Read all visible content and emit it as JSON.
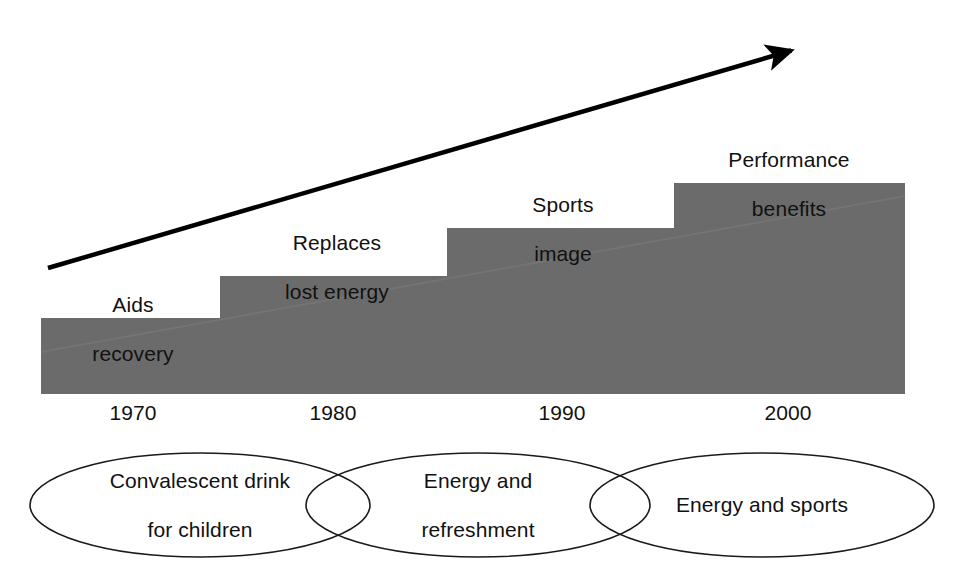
{
  "figure": {
    "type": "evolution-step-diagram",
    "background_color": "#ffffff",
    "step_fill_color": "#6b6b6b",
    "line_color": "#000000",
    "text_color": "#111111"
  },
  "chart_data": {
    "type": "bar",
    "title": "",
    "subtitle": "",
    "xlabel": "",
    "ylabel": "",
    "grid": false,
    "legend": "none",
    "categories": [
      "1970",
      "1980",
      "1990",
      "2000"
    ],
    "values": [
      1,
      2,
      3,
      4
    ],
    "value_labels": [
      "Aids recovery",
      "Replaces lost energy",
      "Sports image",
      "Performance benefits"
    ],
    "annotations": [
      {
        "name": "growth-arrow",
        "text": "",
        "from": [
          48,
          268
        ],
        "to": [
          800,
          48
        ]
      }
    ],
    "overlay_sets": [
      "Convalescent drink for children",
      "Energy and refreshment",
      "Energy and sports"
    ]
  },
  "steps": [
    {
      "id": "step-1970",
      "label_line1": "Aids",
      "label_line2": "recovery",
      "year": "1970",
      "x0": 41,
      "x1": 220,
      "top": 318
    },
    {
      "id": "step-1980",
      "label_line1": "Replaces",
      "label_line2": "lost energy",
      "year": "1980",
      "x0": 220,
      "x1": 447,
      "top": 276
    },
    {
      "id": "step-1990",
      "label_line1": "Sports",
      "label_line2": "image",
      "year": "1990",
      "x0": 447,
      "x1": 674,
      "top": 228
    },
    {
      "id": "step-2000",
      "label_line1": "Performance",
      "label_line2": "benefits",
      "year": "2000",
      "x0": 674,
      "x1": 905,
      "top": 183
    }
  ],
  "step_labels": [
    {
      "line1": "Aids",
      "line2": "recovery",
      "cx": 133,
      "y": 268
    },
    {
      "line1": "Replaces",
      "line2": "lost energy",
      "cx": 337,
      "y": 206
    },
    {
      "line1": "Sports",
      "line2": "image",
      "cx": 563,
      "y": 168
    },
    {
      "line1": "Performance",
      "line2": "benefits",
      "cx": 789,
      "y": 123
    }
  ],
  "years": [
    {
      "text": "1970",
      "cx": 133,
      "y": 401
    },
    {
      "text": "1980",
      "cx": 333,
      "y": 401
    },
    {
      "text": "1990",
      "cx": 562,
      "y": 401
    },
    {
      "text": "2000",
      "cx": 788,
      "y": 401
    }
  ],
  "ellipses": [
    {
      "id": "ellipse-convalescent",
      "line1": "Convalescent drink",
      "line2": "for children",
      "cx": 200,
      "cy": 505,
      "rx": 170,
      "ry": 52
    },
    {
      "id": "ellipse-energy-refreshment",
      "line1": "Energy and",
      "line2": "refreshment",
      "cx": 478,
      "cy": 505,
      "rx": 172,
      "ry": 52
    },
    {
      "id": "ellipse-energy-sports",
      "line1": "Energy and sports",
      "line2": "",
      "cx": 762,
      "cy": 505,
      "rx": 172,
      "ry": 52
    }
  ]
}
